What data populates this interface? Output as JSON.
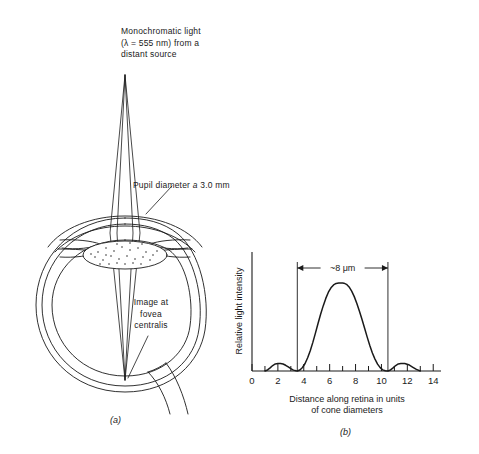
{
  "figure": {
    "panel_a": {
      "label": "(a)",
      "source_label_line1": "Monochromatic light",
      "source_label_line2": "(λ = 555 nm) from a",
      "source_label_line3": "distant source",
      "pupil_label_pre": "Pupil diameter ",
      "pupil_label_italic": "a",
      "pupil_label_post": " 3.0 mm",
      "fovea_label_line1": "Image at",
      "fovea_label_line2": "fovea",
      "fovea_label_line3": "centralis"
    },
    "panel_b": {
      "label": "(b)",
      "annotation": "~8 μm"
    }
  },
  "chart_data": {
    "type": "line",
    "title": "",
    "xlabel_line1": "Distance along retina in units",
    "xlabel_line2": "of cone diameters",
    "ylabel": "Relative light intensity",
    "xlim": [
      0,
      14.6
    ],
    "ylim": [
      0,
      1.12
    ],
    "grid": false,
    "legend": "none",
    "xticks_major": [
      0,
      2,
      4,
      6,
      8,
      10,
      12,
      14
    ],
    "xticks_minor": [
      1,
      3,
      5,
      7,
      9,
      11,
      13
    ],
    "xtick_labels": [
      "0",
      "2",
      "4",
      "6",
      "8",
      "10",
      "12",
      "14"
    ],
    "ytick_labels": [],
    "annotation_span": [
      3.5,
      10.5
    ],
    "annotation_text": "~8 μm",
    "peak_x": 7.0,
    "peak_y": 1.0,
    "zeros": [
      3.5,
      10.5
    ],
    "side_lobe_peaks": [
      {
        "x": 2.2,
        "y": 0.085
      },
      {
        "x": 11.8,
        "y": 0.085
      }
    ],
    "series": [
      {
        "name": "Airy diffraction intensity",
        "x": [
          1.0,
          1.2,
          1.4,
          1.6,
          1.8,
          2.0,
          2.2,
          2.4,
          2.6,
          2.8,
          3.0,
          3.2,
          3.4,
          3.5,
          3.7,
          3.9,
          4.1,
          4.3,
          4.5,
          4.7,
          4.9,
          5.1,
          5.3,
          5.5,
          5.7,
          5.9,
          6.1,
          6.3,
          6.5,
          6.7,
          6.9,
          7.0,
          7.1,
          7.3,
          7.5,
          7.7,
          7.9,
          8.1,
          8.3,
          8.5,
          8.7,
          8.9,
          9.1,
          9.3,
          9.5,
          9.7,
          9.9,
          10.1,
          10.3,
          10.5,
          10.7,
          10.9,
          11.1,
          11.3,
          11.5,
          11.8,
          12.1,
          12.4,
          12.7,
          13.0
        ],
        "y": [
          0.0,
          0.012,
          0.035,
          0.062,
          0.08,
          0.085,
          0.086,
          0.08,
          0.065,
          0.046,
          0.026,
          0.01,
          0.002,
          0.0,
          0.012,
          0.04,
          0.085,
          0.15,
          0.23,
          0.325,
          0.43,
          0.54,
          0.645,
          0.74,
          0.825,
          0.895,
          0.945,
          0.978,
          0.995,
          1.0,
          1.0,
          1.0,
          0.998,
          0.985,
          0.955,
          0.908,
          0.845,
          0.768,
          0.68,
          0.585,
          0.485,
          0.385,
          0.29,
          0.205,
          0.135,
          0.078,
          0.038,
          0.013,
          0.002,
          0.0,
          0.012,
          0.035,
          0.062,
          0.08,
          0.085,
          0.086,
          0.072,
          0.045,
          0.018,
          0.0
        ]
      }
    ]
  }
}
